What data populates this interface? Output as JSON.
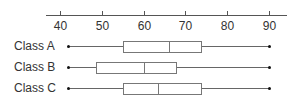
{
  "chart_data": {
    "type": "boxplot",
    "orientation": "horizontal",
    "title": "",
    "xlabel": "",
    "ylabel": "",
    "xlim": [
      38,
      95
    ],
    "x_ticks": [
      40,
      50,
      60,
      70,
      80,
      90
    ],
    "x_tick_labels": [
      "40",
      "50",
      "60",
      "70",
      "80",
      "90"
    ],
    "axis_position": "top",
    "grid": false,
    "categories": [
      "Class A",
      "Class B",
      "Class C"
    ],
    "series": [
      {
        "name": "Class A",
        "min": 42,
        "q1": 55,
        "median": 66,
        "q3": 74,
        "max": 90
      },
      {
        "name": "Class B",
        "min": 42,
        "q1": 48.5,
        "median": 60,
        "q3": 68,
        "max": 90
      },
      {
        "name": "Class C",
        "min": 42,
        "q1": 55,
        "median": 63.5,
        "q3": 74,
        "max": 90
      }
    ]
  },
  "colors": {
    "axis": "#555555",
    "box_border": "#777777",
    "whisker": "#666666",
    "dot": "#111111",
    "text": "#333333"
  }
}
